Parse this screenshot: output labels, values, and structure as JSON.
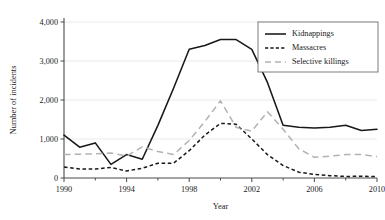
{
  "chart_data": {
    "type": "line",
    "title": "",
    "xlabel": "Year",
    "ylabel": "Number of incidents",
    "xlim": [
      1990,
      2010
    ],
    "ylim": [
      0,
      4000
    ],
    "grid": true,
    "legend_position": "top-right",
    "x": [
      1990,
      1991,
      1992,
      1993,
      1994,
      1995,
      1996,
      1997,
      1998,
      1999,
      2000,
      2001,
      2002,
      2003,
      2004,
      2005,
      2006,
      2007,
      2008,
      2009,
      2010
    ],
    "xticks": [
      "1990",
      "1994",
      "1998",
      "2002",
      "2006",
      "2010"
    ],
    "xtick_values": [
      1990,
      1994,
      1998,
      2002,
      2006,
      2010
    ],
    "yticks": [
      "0",
      "1,000",
      "2,000",
      "3,000",
      "4,000"
    ],
    "ytick_values": [
      0,
      1000,
      2000,
      3000,
      4000
    ],
    "series": [
      {
        "name": "Kidnappings",
        "style": "solid",
        "color": "#17181a",
        "values": [
          1100,
          790,
          900,
          350,
          600,
          480,
          1350,
          2300,
          3300,
          3400,
          3550,
          3550,
          3300,
          2450,
          1350,
          1300,
          1280,
          1300,
          1350,
          1220,
          1250
        ]
      },
      {
        "name": "Massacres",
        "style": "dotted",
        "color": "#17181a",
        "values": [
          280,
          230,
          230,
          270,
          180,
          250,
          380,
          380,
          700,
          1100,
          1400,
          1380,
          1000,
          600,
          320,
          150,
          90,
          60,
          40,
          45,
          35
        ]
      },
      {
        "name": "Selective killings",
        "style": "dashed",
        "color": "#b2b2b2",
        "values": [
          600,
          610,
          620,
          640,
          560,
          800,
          680,
          600,
          960,
          1450,
          1980,
          1300,
          1200,
          1700,
          1250,
          750,
          530,
          560,
          600,
          600,
          550
        ]
      }
    ]
  },
  "legend": {
    "items": [
      {
        "label": "Kidnappings"
      },
      {
        "label": "Massacres"
      },
      {
        "label": "Selective killings"
      }
    ]
  }
}
